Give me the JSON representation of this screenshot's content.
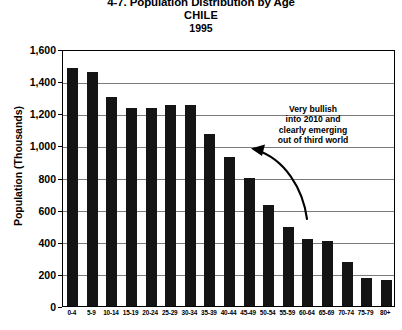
{
  "chart_data": {
    "type": "bar",
    "title": "4-7. Population Distribution by Age",
    "subtitle": "CHILE",
    "year": "1995",
    "xlabel": "",
    "ylabel": "Population (Thousands)",
    "ylim": [
      0,
      1600
    ],
    "ytick_step": 200,
    "ytick_labels": [
      "1,600",
      "1,400",
      "1,200",
      "1,000",
      "800",
      "600",
      "400",
      "200",
      "0"
    ],
    "ytick_values": [
      1600,
      1400,
      1200,
      1000,
      800,
      600,
      400,
      200,
      0
    ],
    "grid": true,
    "legend": false,
    "bar_color": "#141414",
    "categories": [
      "0-4",
      "5-9",
      "10-14",
      "15-19",
      "20-24",
      "25-29",
      "30-34",
      "35-39",
      "40-44",
      "45-49",
      "50-54",
      "55-59",
      "60-64",
      "65-69",
      "70-74",
      "75-79",
      "80+"
    ],
    "values": [
      1480,
      1460,
      1300,
      1230,
      1230,
      1250,
      1250,
      1070,
      930,
      800,
      630,
      490,
      420,
      405,
      275,
      175,
      165
    ],
    "annotations": [
      {
        "text": "Very bullish into 2010 and clearly emerging out of third world",
        "lines": [
          "Very bullish",
          "into 2010 and",
          "clearly emerging",
          "out of third world"
        ],
        "arrow": "curved arrow pointing left toward the 25-29 bar"
      }
    ]
  },
  "chart": {
    "title": "4-7. Population Distribution by Age",
    "subtitle": "CHILE",
    "year": "1995",
    "ylabel": "Population (Thousands)"
  },
  "annotation": {
    "line1": "Very bullish",
    "line2": "into 2010 and",
    "line3": "clearly emerging",
    "line4": "out of third world"
  }
}
